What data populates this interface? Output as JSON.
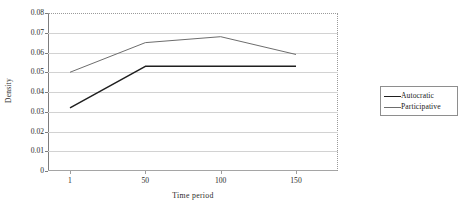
{
  "chart_data": {
    "type": "line",
    "title": "",
    "xlabel": "Time period",
    "ylabel": "Density",
    "categories": [
      "1",
      "50",
      "100",
      "150"
    ],
    "ylim": [
      0,
      0.08
    ],
    "yticks": [
      "0.08",
      "0.07",
      "0.06",
      "0.05",
      "0.04",
      "0.03",
      "0.02",
      "0.01",
      "0"
    ],
    "ytick_values": [
      0.08,
      0.07,
      0.06,
      0.05,
      0.04,
      0.03,
      0.02,
      0.01,
      0
    ],
    "grid": true,
    "legend_position": "right",
    "series": [
      {
        "name": "Autocratic",
        "values": [
          0.032,
          0.053,
          0.053,
          0.053
        ],
        "color": "#1f1f1f",
        "style": "solid",
        "width": 1.5
      },
      {
        "name": "Participative",
        "values": [
          0.05,
          0.065,
          0.068,
          0.059
        ],
        "color": "#6d6d6d",
        "style": "thin",
        "width": 1.0
      }
    ]
  },
  "legend": {
    "items": [
      {
        "label": "Autocratic",
        "swatch": "solid"
      },
      {
        "label": "Participative",
        "swatch": "thin"
      }
    ]
  },
  "axes": {
    "y_title": "Density",
    "x_title": "Time period"
  }
}
